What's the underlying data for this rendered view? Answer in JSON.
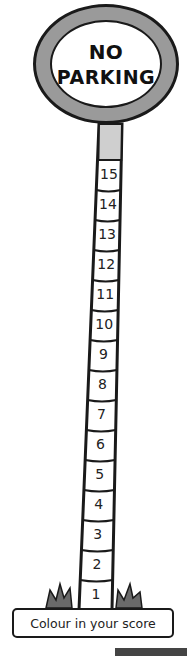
{
  "sign": {
    "line1": "NO",
    "line2": "PARKING",
    "ring_color": "#9a9a9a",
    "outline_color": "#1a1a1a"
  },
  "pole": {
    "cap_color": "#cfcfcf",
    "segments": [
      {
        "label": "15"
      },
      {
        "label": "14"
      },
      {
        "label": "13"
      },
      {
        "label": "12"
      },
      {
        "label": "11"
      },
      {
        "label": "10"
      },
      {
        "label": "9"
      },
      {
        "label": "8"
      },
      {
        "label": "7"
      },
      {
        "label": "6"
      },
      {
        "label": "5"
      },
      {
        "label": "4"
      },
      {
        "label": "3"
      },
      {
        "label": "2"
      },
      {
        "label": "1"
      }
    ]
  },
  "grass_color": "#6a6a6a",
  "banner": {
    "label": "Colour in your score"
  }
}
